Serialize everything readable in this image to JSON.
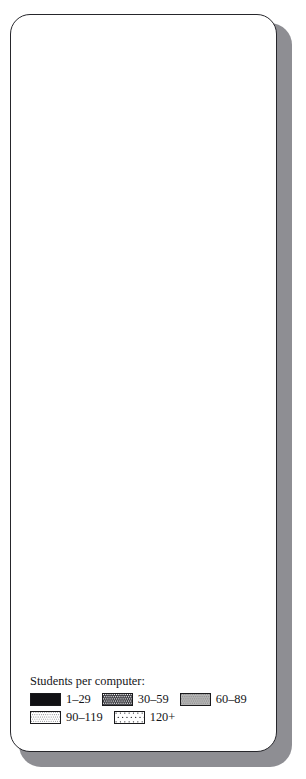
{
  "figure": {
    "legend_title": "Students per computer:",
    "legend_items": [
      {
        "label": "1–29",
        "pattern": "solid-black",
        "key": "k1"
      },
      {
        "label": "30–59",
        "pattern": "dark-crosshatch",
        "key": "k2"
      },
      {
        "label": "60–89",
        "pattern": "medium-gray-stipple",
        "key": "k3"
      },
      {
        "label": "90–119",
        "pattern": "dense-dots",
        "key": "k4"
      },
      {
        "label": "120+",
        "pattern": "sparse-dots",
        "key": "k5"
      }
    ]
  },
  "chart_data": [
    {
      "type": "pie",
      "title": "Elementary schools with computers",
      "categories": [
        "1–29",
        "120+",
        "90–119",
        "60–89",
        "30–59"
      ],
      "values": [
        34.5,
        10.7,
        7.1,
        14.4,
        33.3
      ],
      "labels": [
        "34.5%",
        "10.7%",
        "7.1%",
        "14.4%",
        "33.3%"
      ],
      "legend": [
        "1–29",
        "30–59",
        "60–89",
        "90–119",
        "120+"
      ],
      "ylabel": "",
      "xlabel": "",
      "start_angle_deg": 0,
      "direction": "clockwise"
    },
    {
      "type": "pie",
      "title": "Junior high schools with computers",
      "categories": [
        "1–29",
        "120+",
        "90–119",
        "60–89",
        "30–59"
      ],
      "values": [
        43.4,
        6.6,
        4.8,
        10.9,
        34.3
      ],
      "labels": [
        "43.4%",
        "6.6%",
        "4.8%",
        "10.9%",
        "34.3%"
      ],
      "legend": [
        "1–29",
        "30–59",
        "60–89",
        "90–119",
        "120+"
      ],
      "ylabel": "",
      "xlabel": "",
      "start_angle_deg": 0,
      "direction": "clockwise"
    },
    {
      "type": "pie",
      "title": "High schools with computers",
      "categories": [
        "1–29",
        "120+",
        "90–119",
        "60–89",
        "30–59"
      ],
      "values": [
        53.1,
        3.9,
        3.4,
        8.2,
        31.4
      ],
      "labels": [
        "53.1%",
        "3.9%",
        "3.4%",
        "8.2%",
        "31.4%"
      ],
      "legend": [
        "1–29",
        "30–59",
        "60–89",
        "90–119",
        "120+"
      ],
      "ylabel": "",
      "xlabel": "",
      "start_angle_deg": 0,
      "direction": "clockwise"
    }
  ],
  "pie1": {
    "caption": "Elementary schools with computers",
    "p_black": "34.5%",
    "p_sparse": "10.7%",
    "p_dense": "7.1%",
    "p_gray": "14.4%",
    "p_cross": "33.3%"
  },
  "pie2": {
    "caption": "Junior high schools with computers",
    "p_black": "43.4%",
    "p_sparse": "6.6%",
    "p_dense": "4.8%",
    "p_gray": "10.9%",
    "p_cross": "34.3%"
  },
  "pie3": {
    "caption": "High schools with computers",
    "p_black": "53.1%",
    "p_sparse": "3.9%",
    "p_dense": "3.4%",
    "p_gray": "8.2%",
    "p_cross": "31.4%"
  }
}
